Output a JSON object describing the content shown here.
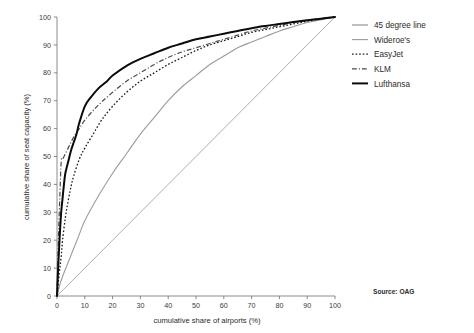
{
  "chart_data": {
    "type": "line",
    "title": "",
    "subtitle": "",
    "xlabel": "cumulative share of airports (%)",
    "ylabel": "cumulative share of seat capacity (%)",
    "xlim": [
      0,
      100
    ],
    "ylim": [
      0,
      100
    ],
    "xticks": [
      0,
      10,
      20,
      30,
      40,
      50,
      60,
      70,
      80,
      90,
      100
    ],
    "yticks": [
      0,
      10,
      20,
      30,
      40,
      50,
      60,
      70,
      80,
      90,
      100
    ],
    "grid": false,
    "legend_position": "right",
    "annotations": [
      {
        "name": "source-note",
        "text": "Source: OAG"
      },
      {
        "name": "edge-watermark",
        "text": ""
      }
    ],
    "series": [
      {
        "name": "45 degree line",
        "style": "solid",
        "color": "#8a8a8a",
        "width": 0.7,
        "points": [
          [
            0,
            0
          ],
          [
            10,
            10
          ],
          [
            20,
            20
          ],
          [
            30,
            30
          ],
          [
            40,
            40
          ],
          [
            50,
            50
          ],
          [
            60,
            60
          ],
          [
            70,
            70
          ],
          [
            80,
            80
          ],
          [
            90,
            90
          ],
          [
            100,
            100
          ]
        ]
      },
      {
        "name": "Wideroe's",
        "style": "solid",
        "color": "#9b9b9b",
        "width": 1.1,
        "points": [
          [
            0,
            0
          ],
          [
            1,
            4
          ],
          [
            2,
            7
          ],
          [
            4,
            12
          ],
          [
            6,
            17
          ],
          [
            8,
            22
          ],
          [
            10,
            27
          ],
          [
            15,
            36
          ],
          [
            20,
            44
          ],
          [
            25,
            51
          ],
          [
            30,
            58
          ],
          [
            35,
            64
          ],
          [
            40,
            70
          ],
          [
            45,
            75
          ],
          [
            50,
            79
          ],
          [
            55,
            83
          ],
          [
            60,
            86
          ],
          [
            65,
            89
          ],
          [
            70,
            91
          ],
          [
            75,
            93
          ],
          [
            80,
            95
          ],
          [
            85,
            96.5
          ],
          [
            90,
            98
          ],
          [
            95,
            99
          ],
          [
            100,
            100
          ]
        ]
      },
      {
        "name": "EasyJet",
        "style": "dotted",
        "color": "#1c1c1c",
        "width": 1.3,
        "points": [
          [
            0,
            0
          ],
          [
            0.8,
            8
          ],
          [
            1.5,
            14
          ],
          [
            2,
            20
          ],
          [
            3,
            28
          ],
          [
            4,
            34
          ],
          [
            5,
            39
          ],
          [
            6,
            43
          ],
          [
            8,
            49
          ],
          [
            10,
            53
          ],
          [
            13,
            58
          ],
          [
            16,
            63
          ],
          [
            20,
            68
          ],
          [
            25,
            73
          ],
          [
            30,
            77
          ],
          [
            35,
            80
          ],
          [
            40,
            83
          ],
          [
            45,
            85.5
          ],
          [
            50,
            88
          ],
          [
            55,
            90
          ],
          [
            60,
            91.5
          ],
          [
            65,
            93
          ],
          [
            70,
            94.5
          ],
          [
            75,
            95.5
          ],
          [
            80,
            96.5
          ],
          [
            85,
            97.5
          ],
          [
            90,
            98.5
          ],
          [
            95,
            99.3
          ],
          [
            100,
            100
          ]
        ]
      },
      {
        "name": "KLM",
        "style": "dashdot",
        "color": "#4a4a4a",
        "width": 1.2,
        "points": [
          [
            0,
            0
          ],
          [
            0.5,
            20
          ],
          [
            1,
            35
          ],
          [
            1.5,
            48
          ],
          [
            2,
            49
          ],
          [
            3,
            51
          ],
          [
            4,
            53
          ],
          [
            5,
            55
          ],
          [
            6,
            57
          ],
          [
            8,
            60
          ],
          [
            10,
            63
          ],
          [
            13,
            66.5
          ],
          [
            16,
            69.5
          ],
          [
            20,
            73
          ],
          [
            25,
            77
          ],
          [
            30,
            80
          ],
          [
            35,
            83
          ],
          [
            40,
            85.5
          ],
          [
            45,
            87.5
          ],
          [
            50,
            89
          ],
          [
            55,
            90.5
          ],
          [
            60,
            92
          ],
          [
            65,
            93.5
          ],
          [
            70,
            95
          ],
          [
            75,
            96
          ],
          [
            80,
            97
          ],
          [
            85,
            98
          ],
          [
            90,
            98.8
          ],
          [
            95,
            99.5
          ],
          [
            100,
            100
          ]
        ]
      },
      {
        "name": "Lufthansa",
        "style": "solid",
        "color": "#0b0b0b",
        "width": 2.0,
        "points": [
          [
            0,
            0
          ],
          [
            0.5,
            12
          ],
          [
            1,
            22
          ],
          [
            1.5,
            30
          ],
          [
            2,
            35
          ],
          [
            2.5,
            40
          ],
          [
            3,
            44
          ],
          [
            4,
            48
          ],
          [
            5,
            52
          ],
          [
            6,
            55
          ],
          [
            7,
            58
          ],
          [
            8,
            62
          ],
          [
            10,
            68
          ],
          [
            12,
            71
          ],
          [
            15,
            74.5
          ],
          [
            18,
            77
          ],
          [
            20,
            79
          ],
          [
            25,
            82.5
          ],
          [
            30,
            85
          ],
          [
            35,
            87
          ],
          [
            40,
            89
          ],
          [
            45,
            90.5
          ],
          [
            50,
            92
          ],
          [
            55,
            93
          ],
          [
            60,
            94
          ],
          [
            65,
            95
          ],
          [
            70,
            96
          ],
          [
            75,
            96.8
          ],
          [
            80,
            97.5
          ],
          [
            85,
            98.2
          ],
          [
            90,
            98.8
          ],
          [
            95,
            99.4
          ],
          [
            100,
            100
          ]
        ]
      }
    ]
  },
  "legend": {
    "items": [
      {
        "label": "45 degree line",
        "swatch": "line-solid-gray"
      },
      {
        "label": "Wideroe's",
        "swatch": "line-solid-lightgray"
      },
      {
        "label": "EasyJet",
        "swatch": "line-dotted-black"
      },
      {
        "label": "KLM",
        "swatch": "line-dashdot-darkgray"
      },
      {
        "label": "Lufthansa",
        "swatch": "line-solid-black-thick"
      }
    ]
  },
  "axes": {
    "x_title": "cumulative share of airports (%)",
    "y_title": "cumulative share of seat capacity (%)",
    "x_tick_labels": [
      "0",
      "10",
      "20",
      "30",
      "40",
      "50",
      "60",
      "70",
      "80",
      "90",
      "100"
    ],
    "y_tick_labels": [
      "0",
      "10",
      "20",
      "30",
      "40",
      "50",
      "60",
      "70",
      "80",
      "90",
      "100"
    ]
  },
  "notes": {
    "source": "Source: OAG",
    "watermark": ""
  },
  "colors": {
    "line_45": "#8a8a8a",
    "line_wideroe": "#9b9b9b",
    "line_easyjet": "#1c1c1c",
    "line_klm": "#4a4a4a",
    "line_lufthansa": "#0b0b0b",
    "axis": "#6f6f6f",
    "text": "#2b2b2b",
    "background": "#ffffff"
  }
}
